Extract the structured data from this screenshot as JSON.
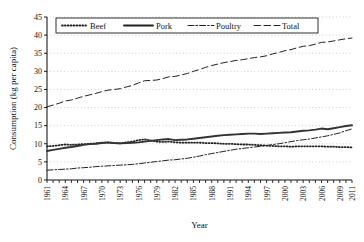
{
  "chart_data": {
    "type": "line",
    "title": "",
    "xlabel": "Year",
    "ylabel": "Consumption (kg per capita)",
    "xlim": [
      1961,
      2011
    ],
    "ylim": [
      0,
      45
    ],
    "ytick_step": 5,
    "yticks": [
      "0",
      "5",
      "10",
      "15",
      "20",
      "25",
      "30",
      "35",
      "40",
      "45"
    ],
    "xticks": [
      "1961",
      "1964",
      "1967",
      "1970",
      "1973",
      "1976",
      "1979",
      "1982",
      "1985",
      "1988",
      "1991",
      "1994",
      "1997",
      "2000",
      "2003",
      "2006",
      "2009",
      "2011"
    ],
    "grid": "horizontal-dotted",
    "legend_position": "top-inside",
    "x": [
      1961,
      1962,
      1963,
      1964,
      1965,
      1966,
      1967,
      1968,
      1969,
      1970,
      1971,
      1972,
      1973,
      1974,
      1975,
      1976,
      1977,
      1978,
      1979,
      1980,
      1981,
      1982,
      1983,
      1984,
      1985,
      1986,
      1987,
      1988,
      1989,
      1990,
      1991,
      1992,
      1993,
      1994,
      1995,
      1996,
      1997,
      1998,
      1999,
      2000,
      2001,
      2002,
      2003,
      2004,
      2005,
      2006,
      2007,
      2008,
      2009,
      2010,
      2011
    ],
    "series": [
      {
        "name": "Beef",
        "style": "dotted",
        "color": "#222222",
        "values": [
          9.3,
          9.4,
          9.6,
          9.8,
          9.7,
          9.8,
          9.9,
          10.0,
          10.1,
          10.3,
          10.3,
          10.2,
          10.1,
          10.4,
          10.6,
          11.0,
          11.2,
          10.9,
          10.6,
          10.5,
          10.6,
          10.4,
          10.3,
          10.3,
          10.3,
          10.3,
          10.2,
          10.2,
          10.1,
          10.0,
          10.0,
          9.9,
          9.8,
          9.8,
          9.7,
          9.6,
          9.5,
          9.4,
          9.3,
          9.3,
          9.2,
          9.3,
          9.3,
          9.3,
          9.3,
          9.3,
          9.2,
          9.2,
          9.1,
          9.1,
          9.0
        ]
      },
      {
        "name": "Pork",
        "style": "solid",
        "color": "#333333",
        "values": [
          8.0,
          8.3,
          8.6,
          8.9,
          9.1,
          9.4,
          9.7,
          9.9,
          10.0,
          10.2,
          10.4,
          10.2,
          10.1,
          10.2,
          10.3,
          10.4,
          10.6,
          10.8,
          11.0,
          11.2,
          11.3,
          11.0,
          11.1,
          11.2,
          11.4,
          11.6,
          11.8,
          12.0,
          12.2,
          12.4,
          12.5,
          12.6,
          12.7,
          12.8,
          12.8,
          12.7,
          12.8,
          12.9,
          13.0,
          13.1,
          13.2,
          13.4,
          13.6,
          13.7,
          13.9,
          14.2,
          14.0,
          14.3,
          14.6,
          14.9,
          15.1
        ]
      },
      {
        "name": "Poultry",
        "style": "dashdot",
        "color": "#222222",
        "values": [
          2.7,
          2.8,
          2.9,
          3.0,
          3.1,
          3.3,
          3.4,
          3.5,
          3.7,
          3.8,
          3.9,
          4.0,
          4.1,
          4.2,
          4.3,
          4.5,
          4.7,
          4.9,
          5.1,
          5.3,
          5.5,
          5.6,
          5.8,
          6.0,
          6.3,
          6.6,
          7.0,
          7.3,
          7.6,
          7.9,
          8.2,
          8.5,
          8.7,
          8.9,
          9.1,
          9.3,
          9.5,
          9.8,
          10.0,
          10.3,
          10.6,
          10.9,
          11.1,
          11.3,
          11.6,
          11.9,
          12.2,
          12.6,
          13.0,
          13.6,
          14.1
        ]
      },
      {
        "name": "Total",
        "style": "dashed",
        "color": "#222222",
        "values": [
          20.2,
          20.7,
          21.2,
          21.8,
          22.1,
          22.6,
          23.1,
          23.5,
          23.9,
          24.4,
          24.8,
          25.0,
          25.2,
          25.7,
          26.1,
          26.8,
          27.4,
          27.5,
          27.6,
          28.0,
          28.5,
          28.6,
          29.0,
          29.4,
          30.0,
          30.5,
          31.1,
          31.6,
          32.0,
          32.4,
          32.7,
          33.0,
          33.2,
          33.5,
          33.8,
          34.0,
          34.3,
          34.8,
          35.2,
          35.7,
          36.0,
          36.5,
          36.9,
          37.1,
          37.5,
          38.0,
          38.1,
          38.4,
          38.7,
          39.0,
          39.2
        ]
      }
    ],
    "legend": [
      {
        "label": "Beef",
        "style": "dotted"
      },
      {
        "label": "Pork",
        "style": "solid"
      },
      {
        "label": "Poultry",
        "style": "dashdot"
      },
      {
        "label": "Total",
        "style": "dashed"
      }
    ]
  }
}
